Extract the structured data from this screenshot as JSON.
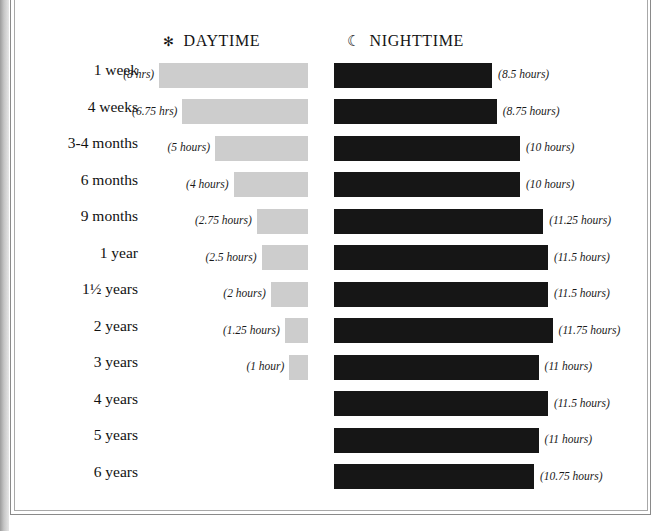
{
  "header": {
    "daytime": {
      "icon": "sun-icon",
      "glyph": "✻",
      "label": "DAYTIME"
    },
    "nighttime": {
      "icon": "moon-icon",
      "glyph": "☾",
      "label": "NIGHTTIME"
    }
  },
  "colors": {
    "daytime_bar": "#cdcdcd",
    "nighttime_bar": "#161616",
    "text": "#111111"
  },
  "chart_data": {
    "type": "bar",
    "title": "",
    "xlabel": "",
    "ylabel": "",
    "orientation": "horizontal",
    "layout": "diverging-paired",
    "grid": false,
    "legend_position": "top",
    "unit": "hours",
    "categories": [
      "1  week",
      "4 weeks",
      "3-4 months",
      "6 months",
      "9 months",
      "1  year",
      "1½ years",
      "2 years",
      "3 years",
      "4 years",
      "5 years",
      "6 years"
    ],
    "series": [
      {
        "name": "DAYTIME",
        "color": "#cdcdcd",
        "direction": "right-aligned",
        "values": [
          8,
          6.75,
          5,
          4,
          2.75,
          2.5,
          2,
          1.25,
          1,
          null,
          null,
          null
        ],
        "labels": [
          "(8 hrs)",
          "(6.75 hrs)",
          "(5 hours)",
          "(4 hours)",
          "(2.75 hours)",
          "(2.5 hours)",
          "(2 hours)",
          "(1.25 hours)",
          "(1 hour)",
          "",
          "",
          ""
        ]
      },
      {
        "name": "NIGHTTIME",
        "color": "#161616",
        "direction": "left-aligned",
        "values": [
          8.5,
          8.75,
          10,
          10,
          11.25,
          11.5,
          11.5,
          11.75,
          11,
          11.5,
          11,
          10.75
        ],
        "labels": [
          "(8.5 hours)",
          "(8.75 hours)",
          "(10 hours)",
          "(10 hours)",
          "(11.25 hours)",
          "(11.5 hours)",
          "(11.5 hours)",
          "(11.75 hours)",
          "(11 hours)",
          "(11.5 hours)",
          "(11 hours)",
          "(10.75 hours)"
        ]
      }
    ],
    "xlim": [
      0,
      12
    ]
  }
}
